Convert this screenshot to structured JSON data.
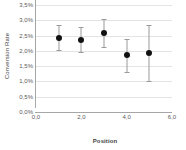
{
  "chart_data": {
    "type": "scatter",
    "title": "",
    "xlabel": "Position",
    "ylabel": "Conversion Rate",
    "xlim": [
      0.0,
      6.0
    ],
    "ylim": [
      0.0,
      3.5
    ],
    "grid": true,
    "legend": null,
    "x": [
      1.0,
      2.0,
      3.0,
      4.0,
      5.0
    ],
    "values": [
      2.41,
      2.35,
      2.57,
      1.86,
      1.94
    ],
    "error_low": [
      2.02,
      1.97,
      2.11,
      1.3,
      1.03
    ],
    "error_high": [
      2.84,
      2.78,
      3.05,
      2.39,
      2.84
    ],
    "y_ticks": [
      0.0,
      0.5,
      1.0,
      1.5,
      2.0,
      2.5,
      3.0,
      3.5
    ],
    "y_tick_labels": [
      "0,0%",
      "0,5%",
      "1,0%",
      "1,5%",
      "2,0%",
      "2,5%",
      "3,0%",
      "3,5%"
    ],
    "x_ticks": [
      0.0,
      2.0,
      4.0,
      6.0
    ],
    "x_tick_labels": [
      "0,0",
      "2,0",
      "4,0",
      "6,0"
    ],
    "colors": {
      "marker": "#111111",
      "error_bar": "#9a9a9a",
      "gridline": "#e4e4e4",
      "axis": "#a6a6a6",
      "text": "#5a5a5a",
      "background": "#ffffff"
    }
  }
}
